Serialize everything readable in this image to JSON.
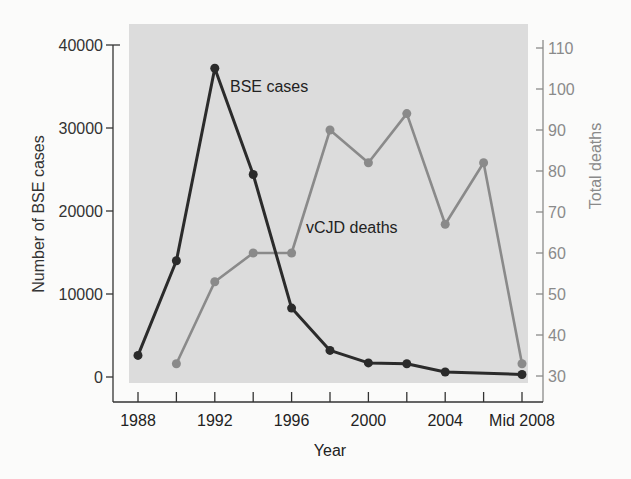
{
  "chart_data": {
    "type": "line",
    "title": "",
    "xlabel": "Year",
    "ylabel": "Number of BSE cases",
    "y2label": "Total deaths",
    "x_ticks": [
      "1988",
      "1992",
      "1996",
      "2000",
      "2004",
      "Mid 2008"
    ],
    "x_positions": [
      "1988",
      "1990",
      "1992",
      "1994",
      "1996",
      "1998",
      "2000",
      "2002",
      "2004",
      "2006",
      "Mid 2008"
    ],
    "ylim": [
      0,
      40000
    ],
    "y_ticks": [
      "0",
      "10000",
      "20000",
      "30000",
      "40000"
    ],
    "y2lim": [
      30,
      110
    ],
    "y2_ticks": [
      "30",
      "40",
      "50",
      "60",
      "70",
      "80",
      "90",
      "100",
      "110"
    ],
    "grid": false,
    "legend": "inline labels",
    "series": [
      {
        "name": "BSE cases",
        "axis": "left",
        "color": "#2b2b2b",
        "x": [
          "1988",
          "1990",
          "1992",
          "1994",
          "1996",
          "1998",
          "2000",
          "2002",
          "2004",
          "Mid 2008"
        ],
        "values": [
          2600,
          14000,
          37200,
          24400,
          8300,
          3200,
          1700,
          1600,
          600,
          300
        ]
      },
      {
        "name": "vCJD deaths",
        "axis": "right",
        "color": "#8a8a8a",
        "x": [
          "1990",
          "1992",
          "1994",
          "1996",
          "1998",
          "2000",
          "2002",
          "2004",
          "2006",
          "Mid 2008"
        ],
        "values": [
          33,
          53,
          60,
          60,
          90,
          82,
          94,
          67,
          82,
          33
        ]
      }
    ]
  },
  "colors": {
    "plot_background": "#dcdcdc",
    "page_background": "#fbfbfa",
    "left_axis": "#333333",
    "right_axis": "#8a8a8a",
    "bse_line": "#2b2b2b",
    "vcjd_line": "#8a8a8a"
  }
}
